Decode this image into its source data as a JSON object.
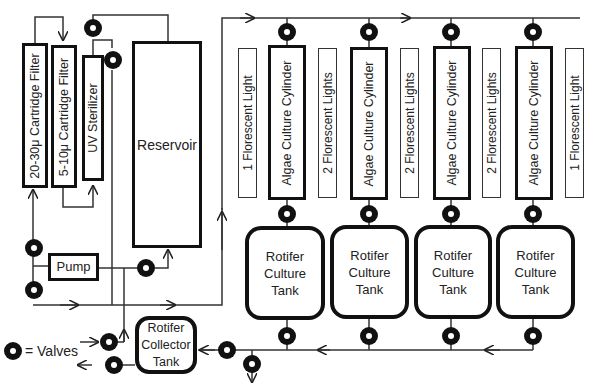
{
  "diagram": {
    "type": "process-flow"
  },
  "filters": {
    "filter1": "20-30μ Cartridge Filter",
    "filter2": "5-10μ Cartridge Filter",
    "uv": "UV Sterilizer"
  },
  "reservoir": "Reservoir",
  "pump": "Pump",
  "collector": {
    "line1": "Rotifer",
    "line2": "Collector",
    "line3": "Tank"
  },
  "legend": {
    "label": "= Valves"
  },
  "lights": [
    "1 Florescent Light",
    "2 Florescent Lights",
    "2 Florescent Lights",
    "2 Florescent Lights",
    "1 Florescent Light"
  ],
  "cylinders": [
    "Algae Culture Cylinder",
    "Algae Culture Cylinder",
    "Algae Culture Cylinder",
    "Algae Culture Cylinder"
  ],
  "tanks": [
    {
      "line1": "Rotifer",
      "line2": "Culture",
      "line3": "Tank"
    },
    {
      "line1": "Rotifer",
      "line2": "Culture",
      "line3": "Tank"
    },
    {
      "line1": "Rotifer",
      "line2": "Culture",
      "line3": "Tank"
    },
    {
      "line1": "Rotifer",
      "line2": "Culture",
      "line3": "Tank"
    }
  ]
}
